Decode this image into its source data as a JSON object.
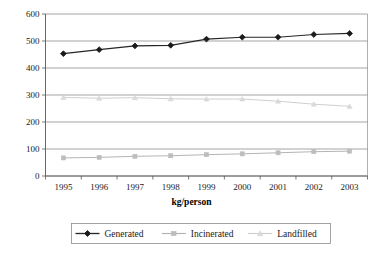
{
  "chart_data": {
    "type": "line",
    "title": "",
    "subtitle": "",
    "xlabel": "kg/person",
    "ylabel": "",
    "categories": [
      "1995",
      "1996",
      "1997",
      "1998",
      "1999",
      "2000",
      "2001",
      "2002",
      "2003"
    ],
    "ylim": [
      0,
      600
    ],
    "ytick_labels": [
      "0",
      "100",
      "200",
      "300",
      "400",
      "500",
      "600"
    ],
    "ytick_values": [
      0,
      100,
      200,
      300,
      400,
      500,
      600
    ],
    "grid": true,
    "grid_axis": "y",
    "legend_position": "bottom",
    "series": [
      {
        "name": "Generated",
        "marker": "diamond",
        "color": "#1a1a1a",
        "line_color": "#262626",
        "values": [
          453,
          468,
          482,
          484,
          507,
          514,
          514,
          524,
          528
        ]
      },
      {
        "name": "Incinerated",
        "marker": "square",
        "color": "#bdbdbd",
        "line_color": "#b0b0b0",
        "values": [
          67,
          69,
          73,
          75,
          79,
          82,
          86,
          90,
          92
        ]
      },
      {
        "name": "Landfilled",
        "marker": "triangle",
        "color": "#d9d9d9",
        "line_color": "#cccccc",
        "values": [
          291,
          288,
          290,
          286,
          285,
          285,
          277,
          266,
          258
        ]
      }
    ]
  },
  "legend": {
    "entries": [
      {
        "label": "Generated"
      },
      {
        "label": "Incinerated"
      },
      {
        "label": "Landfilled"
      }
    ]
  },
  "axis": {
    "x_title": "kg/person"
  },
  "colors": {
    "generated": "#1a1a1a",
    "incinerated": "#bdbdbd",
    "landfilled": "#d9d9d9",
    "grid": "#808080",
    "axis": "#595959",
    "background": "#ffffff"
  }
}
